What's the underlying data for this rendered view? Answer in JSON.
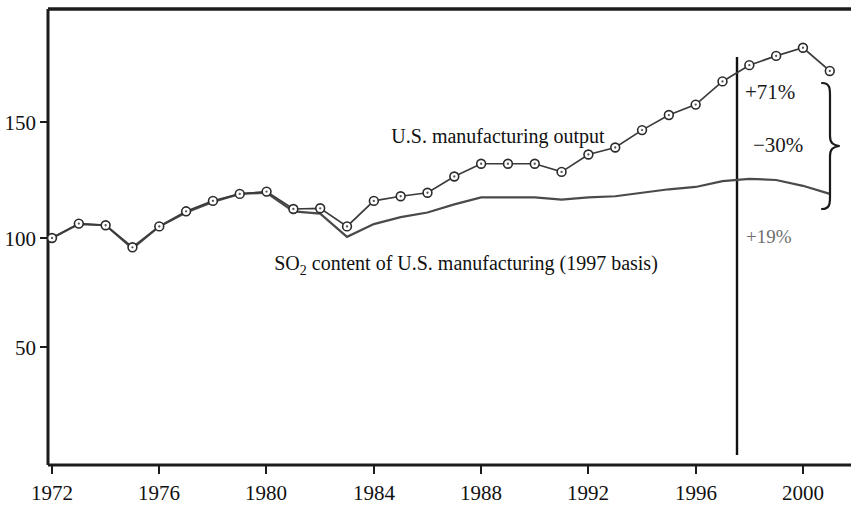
{
  "chart_data": {
    "type": "line",
    "title": "",
    "subtitle": "",
    "xlabel": "",
    "ylabel": "",
    "xlim": [
      1971.3,
      2001.8
    ],
    "ylim": [
      0,
      196
    ],
    "grid": false,
    "legend": "inline-labels",
    "x_ticks": [
      1972,
      1976,
      1980,
      1984,
      1988,
      1992,
      1996,
      2000
    ],
    "x_tick_labels": [
      "1972",
      "1976",
      "1980",
      "1984",
      "1988",
      "1992",
      "1996",
      "2000"
    ],
    "y_ticks": [
      50,
      100,
      150
    ],
    "y_tick_labels": [
      "50",
      "100",
      "150"
    ],
    "x": [
      1972,
      1973,
      1974,
      1975,
      1976,
      1977,
      1978,
      1979,
      1980,
      1981,
      1982,
      1983,
      1984,
      1985,
      1986,
      1987,
      1988,
      1989,
      1990,
      1991,
      1992,
      1993,
      1994,
      1995,
      1996,
      1997,
      1998,
      1999,
      2000,
      2001
    ],
    "series": [
      {
        "name": "U.S. manufacturing output",
        "markers": "open-circle",
        "values": [
          100,
          106.2,
          105.5,
          96,
          105,
          111.5,
          116,
          119,
          120,
          112.5,
          112.8,
          105,
          116,
          118,
          119.5,
          126.5,
          132,
          132,
          132,
          128.5,
          136,
          139,
          146.5,
          153,
          157.5,
          167.5,
          174.5,
          178.5,
          182,
          172
        ]
      },
      {
        "name": "SO2 content of U.S. manufacturing (1997 basis)",
        "markers": "none",
        "values": [
          100,
          106,
          105.5,
          95.5,
          105,
          111,
          115.5,
          119,
          119.5,
          111.5,
          110.5,
          100.5,
          106,
          109,
          111,
          114.5,
          117.5,
          117.5,
          117.5,
          116.5,
          117.5,
          118,
          119.5,
          121,
          122,
          124.5,
          125.5,
          125,
          122.5,
          119
        ]
      }
    ],
    "reference_line": {
      "x": 1997,
      "label": ""
    },
    "annotations": [
      {
        "id": "output-growth",
        "text": "+71%",
        "series": "U.S. manufacturing output",
        "color": "#1a1a1a"
      },
      {
        "id": "gap-difference",
        "text": "−30%",
        "series": "difference",
        "color": "#1a1a1a"
      },
      {
        "id": "so2-growth",
        "text": "+19%",
        "series": "SO2 content",
        "color": "#6e6e6e"
      }
    ],
    "series_inline_labels": [
      {
        "id": "output-label",
        "text": "U.S. manufacturing output"
      },
      {
        "id": "so2-label",
        "text_before": "SO",
        "subscript": "2",
        "text_after": " content of U.S. manufacturing (1997 basis)"
      }
    ]
  },
  "figure": {
    "x_tick_labels": [
      "1972",
      "1976",
      "1980",
      "1984",
      "1988",
      "1992",
      "1996",
      "2000"
    ],
    "y_tick_labels": [
      "150",
      "100",
      "50"
    ],
    "output_label": "U.S. manufacturing output",
    "so2_label_before": "SO",
    "so2_label_sub": "2",
    "so2_label_after": " content of U.S. manufacturing (1997 basis)",
    "annot_output": "+71%",
    "annot_gap": "−30%",
    "annot_so2": "+19%"
  }
}
